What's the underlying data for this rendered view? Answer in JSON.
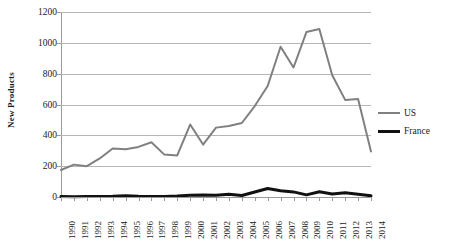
{
  "chart_data": {
    "type": "line",
    "title": "",
    "xlabel": "",
    "ylabel": "New Products",
    "ylim": [
      0,
      1200
    ],
    "ytick_step": 200,
    "yticks": [
      1200,
      1000,
      800,
      600,
      400,
      200,
      0
    ],
    "ytick_labels": [
      "1200",
      "1000",
      "800",
      "600",
      "400",
      "200",
      "0"
    ],
    "grid": true,
    "legend_position": "right",
    "categories": [
      "1990",
      "1991",
      "1992",
      "1993",
      "1994",
      "1995",
      "1996",
      "1997",
      "1998",
      "1999",
      "2000",
      "2001",
      "2002",
      "2003",
      "2004",
      "2005",
      "2006",
      "2007",
      "2008",
      "2009",
      "2010",
      "2011",
      "2012",
      "2013",
      "2014"
    ],
    "series": [
      {
        "name": "US",
        "color": "#808080",
        "line_width": 2,
        "values": [
          175,
          210,
          200,
          250,
          315,
          310,
          325,
          355,
          275,
          270,
          470,
          340,
          450,
          460,
          480,
          590,
          720,
          975,
          840,
          1070,
          1090,
          790,
          630,
          635,
          295
        ]
      },
      {
        "name": "France",
        "color": "#111111",
        "line_width": 3,
        "values": [
          3,
          2,
          3,
          4,
          5,
          8,
          5,
          4,
          4,
          6,
          12,
          13,
          11,
          18,
          10,
          32,
          55,
          40,
          33,
          14,
          34,
          20,
          27,
          18,
          8
        ]
      }
    ]
  },
  "legend": {
    "entries": [
      {
        "label": "US"
      },
      {
        "label": "France"
      }
    ]
  }
}
